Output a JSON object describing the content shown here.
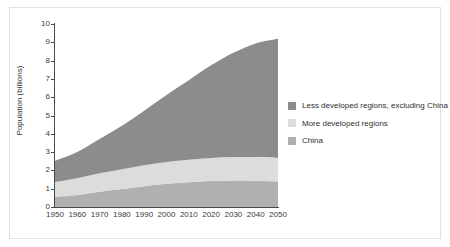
{
  "chart_data": {
    "type": "area",
    "stacked": true,
    "title": "",
    "subtitle": "",
    "xlabel": "",
    "ylabel": "Population (billions)",
    "xlim": [
      1950,
      2050
    ],
    "ylim": [
      0,
      10
    ],
    "grid": false,
    "legend_position": "right",
    "x": [
      1950,
      1960,
      1970,
      1980,
      1990,
      2000,
      2010,
      2020,
      2030,
      2040,
      2050
    ],
    "xticks": [
      "1950",
      "1960",
      "1970",
      "1980",
      "1990",
      "2000",
      "2010",
      "2020",
      "2030",
      "2040",
      "2050"
    ],
    "yticks": [
      "0",
      "1",
      "2",
      "3",
      "4",
      "5",
      "6",
      "7",
      "8",
      "9",
      "10"
    ],
    "series": [
      {
        "name": "China",
        "color": "#b0b0b0",
        "values": [
          0.55,
          0.65,
          0.83,
          0.98,
          1.14,
          1.27,
          1.35,
          1.42,
          1.45,
          1.44,
          1.4
        ]
      },
      {
        "name": "More developed regions",
        "color": "#dcdcdc",
        "values": [
          0.81,
          0.92,
          1.01,
          1.08,
          1.14,
          1.19,
          1.23,
          1.26,
          1.28,
          1.29,
          1.29
        ]
      },
      {
        "name": "Less developed regions, excluding China",
        "color": "#8c8c8c",
        "values": [
          1.17,
          1.44,
          1.87,
          2.38,
          2.98,
          3.66,
          4.35,
          5.06,
          5.7,
          6.21,
          6.5
        ]
      }
    ],
    "totals": [
      2.53,
      3.01,
      3.71,
      4.44,
      5.26,
      6.12,
      6.93,
      7.74,
      8.43,
      8.94,
      9.19
    ]
  },
  "legend": {
    "items": [
      {
        "label": "Less developed regions, excluding China",
        "color": "#8c8c8c"
      },
      {
        "label": "More developed regions",
        "color": "#dcdcdc"
      },
      {
        "label": "China",
        "color": "#b0b0b0"
      }
    ]
  },
  "axes": {
    "y_title": "Population (billions)",
    "y_ticks": [
      "10",
      "9",
      "8",
      "7",
      "6",
      "5",
      "4",
      "3",
      "2",
      "1",
      "0"
    ],
    "x_ticks": [
      "1950",
      "1960",
      "1970",
      "1980",
      "1990",
      "2000",
      "2010",
      "2020",
      "2030",
      "2040",
      "2050"
    ]
  }
}
